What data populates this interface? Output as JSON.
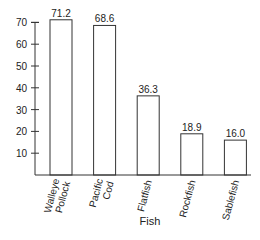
{
  "chart_data": {
    "type": "bar",
    "title": "",
    "xlabel": "Fish",
    "ylabel": "",
    "categories": [
      "Walleye Pollock",
      "Pacific Cod",
      "Flatfish",
      "Rockfish",
      "Sablefish"
    ],
    "category_lines": [
      [
        "Walleye",
        "Pollock"
      ],
      [
        "Pacific",
        "Cod"
      ],
      [
        "Flatfish"
      ],
      [
        "Rockfish"
      ],
      [
        "Sablefish"
      ]
    ],
    "values": [
      71.2,
      68.6,
      36.3,
      18.9,
      16.0
    ],
    "value_labels": [
      "71.2",
      "68.6",
      "36.3",
      "18.9",
      "16.0"
    ],
    "yticks": [
      10,
      20,
      30,
      40,
      50,
      60,
      70
    ],
    "ylim": [
      0,
      72
    ],
    "grid": false,
    "legend": null,
    "bar_fill": "#ffffff",
    "bar_stroke": "#333333"
  }
}
